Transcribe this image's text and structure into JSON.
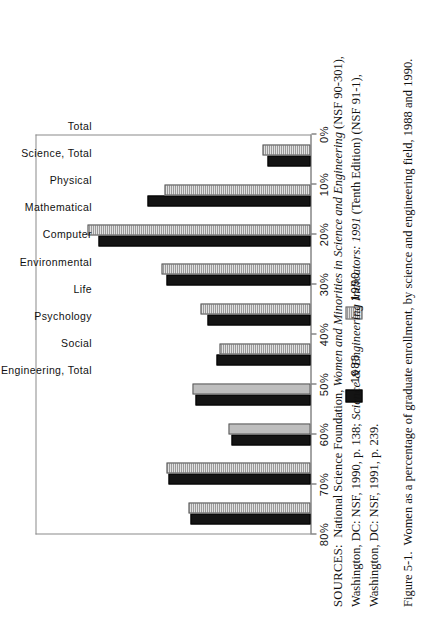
{
  "figure": {
    "number": "Figure 5-1.",
    "caption": "Women as a percentage of graduate enrollment, by science and engineering field, 1988 and 1990."
  },
  "sources": {
    "label": "SOURCES:",
    "line1_a": "National Science Foundation, ",
    "line1_italic": "Women and Minorities in Science and Engineering",
    "line1_b": " (NSF 90-301),",
    "line2_a": "Washington, DC: NSF, 1990, p. 138; ",
    "line2_italic": "Science & Engineering Indicators: 1991",
    "line2_b": " (Tenth Edition) (NSF 91-1),",
    "line3": "Washington, DC: NSF, 1991, p. 239."
  },
  "legend": {
    "items": [
      {
        "label": "1988",
        "swatch": "solid-black-swatch",
        "color": "#141414"
      },
      {
        "label": "1990",
        "swatch": "hatched-gray-swatch",
        "color": "#cccccc"
      }
    ]
  },
  "axis": {
    "ticks": [
      {
        "value": 0,
        "label": "0%"
      },
      {
        "value": 10,
        "label": "10%"
      },
      {
        "value": 20,
        "label": "20%"
      },
      {
        "value": 30,
        "label": "30%"
      },
      {
        "value": 40,
        "label": "40%"
      },
      {
        "value": 50,
        "label": "50%"
      },
      {
        "value": 60,
        "label": "60%"
      },
      {
        "value": 70,
        "label": "70%"
      },
      {
        "value": 80,
        "label": "80%"
      }
    ]
  },
  "chart_data": {
    "type": "bar",
    "title": "Women as a percentage of graduate enrollment, by science and engineering field, 1988 and 1990",
    "xlabel": "",
    "ylabel": "",
    "ylim": [
      0,
      80
    ],
    "grid": false,
    "legend_position": "below-axis",
    "orientation": "vertical-bars-printed-sideways",
    "categories": [
      "Total",
      "Science, Total",
      "Physical",
      "Mathematical",
      "Computer",
      "Environmental",
      "Life",
      "Psychology",
      "Social",
      "Engineering, Total"
    ],
    "series": [
      {
        "name": "1988",
        "values": [
          35,
          41.5,
          23,
          33.5,
          27.5,
          30,
          42,
          62,
          47.5,
          12.5
        ]
      },
      {
        "name": "1990",
        "values": [
          35.5,
          42,
          24,
          34.5,
          26.5,
          32,
          43.5,
          65,
          42.5,
          14
        ]
      }
    ]
  }
}
